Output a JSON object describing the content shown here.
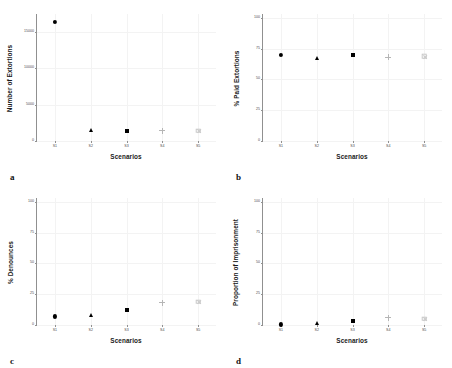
{
  "figure": {
    "panels": [
      {
        "letter": "a",
        "ylabel": "Number of Extortions",
        "xlabel": "Scenarios",
        "yticks": [
          "0",
          "5000",
          "10000",
          "15000"
        ],
        "ytick_values": [
          0,
          5000,
          10000,
          15000
        ],
        "ylim": [
          0,
          17500
        ],
        "xticks": [
          "S1",
          "S2",
          "S3",
          "S4",
          "S5"
        ],
        "values": [
          16400,
          1500,
          1380,
          1420,
          1400
        ],
        "markers": [
          "circle",
          "triangle",
          "square",
          "plus",
          "boxx"
        ]
      },
      {
        "letter": "b",
        "ylabel": "% Paid Extortions",
        "xlabel": "Scenarios",
        "yticks": [
          "0",
          "25",
          "50",
          "75",
          "100"
        ],
        "ytick_values": [
          0,
          25,
          50,
          75,
          100
        ],
        "ylim": [
          0,
          103
        ],
        "xticks": [
          "S1",
          "S2",
          "S3",
          "S4",
          "S5"
        ],
        "values": [
          70,
          67,
          70,
          68,
          69
        ],
        "markers": [
          "circle",
          "triangle",
          "square",
          "plus",
          "boxx"
        ]
      },
      {
        "letter": "c",
        "ylabel": "% Denounces",
        "xlabel": "Scenarios",
        "yticks": [
          "0",
          "25",
          "50",
          "75",
          "100"
        ],
        "ytick_values": [
          0,
          25,
          50,
          75,
          100
        ],
        "ylim": [
          0,
          103
        ],
        "xticks": [
          "S1",
          "S2",
          "S3",
          "S4",
          "S5"
        ],
        "values": [
          7,
          8,
          12,
          18,
          19
        ],
        "markers": [
          "circle",
          "triangle",
          "square",
          "plus",
          "boxx"
        ]
      },
      {
        "letter": "d",
        "ylabel": "Proportion of Imprisonment",
        "xlabel": "Scenarios",
        "yticks": [
          "0",
          "25",
          "50",
          "75",
          "100"
        ],
        "ytick_values": [
          0,
          25,
          50,
          75,
          100
        ],
        "ylim": [
          0,
          103
        ],
        "xticks": [
          "S1",
          "S2",
          "S3",
          "S4",
          "S5"
        ],
        "values": [
          0.5,
          2,
          3,
          6,
          5
        ],
        "markers": [
          "circle",
          "triangle",
          "square",
          "plus",
          "boxx"
        ]
      }
    ]
  },
  "chart_data": [
    {
      "type": "scatter",
      "title": "",
      "panel": "a",
      "xlabel": "Scenarios",
      "ylabel": "Number of Extortions",
      "categories": [
        "S1",
        "S2",
        "S3",
        "S4",
        "S5"
      ],
      "values": [
        16400,
        1500,
        1380,
        1420,
        1400
      ],
      "ylim": [
        0,
        17500
      ],
      "yticks": [
        0,
        5000,
        10000,
        15000
      ],
      "grid": true,
      "legend": "none",
      "markers": [
        "filled-circle",
        "filled-triangle",
        "filled-square",
        "gray-plus",
        "gray-boxed-x"
      ]
    },
    {
      "type": "scatter",
      "title": "",
      "panel": "b",
      "xlabel": "Scenarios",
      "ylabel": "% Paid Extortions",
      "categories": [
        "S1",
        "S2",
        "S3",
        "S4",
        "S5"
      ],
      "values": [
        70,
        67,
        70,
        68,
        69
      ],
      "ylim": [
        0,
        103
      ],
      "yticks": [
        0,
        25,
        50,
        75,
        100
      ],
      "grid": true,
      "legend": "none",
      "markers": [
        "filled-circle",
        "filled-triangle",
        "filled-square",
        "gray-plus",
        "gray-boxed-x"
      ]
    },
    {
      "type": "scatter",
      "title": "",
      "panel": "c",
      "xlabel": "Scenarios",
      "ylabel": "% Denounces",
      "categories": [
        "S1",
        "S2",
        "S3",
        "S4",
        "S5"
      ],
      "values": [
        7,
        8,
        12,
        18,
        19
      ],
      "ylim": [
        0,
        103
      ],
      "yticks": [
        0,
        25,
        50,
        75,
        100
      ],
      "grid": true,
      "legend": "none",
      "markers": [
        "filled-circle",
        "filled-triangle",
        "filled-square",
        "gray-plus",
        "gray-boxed-x"
      ]
    },
    {
      "type": "scatter",
      "title": "",
      "panel": "d",
      "xlabel": "Scenarios",
      "ylabel": "Proportion of Imprisonment",
      "categories": [
        "S1",
        "S2",
        "S3",
        "S4",
        "S5"
      ],
      "values": [
        0.5,
        2,
        3,
        6,
        5
      ],
      "ylim": [
        0,
        103
      ],
      "yticks": [
        0,
        25,
        50,
        75,
        100
      ],
      "grid": true,
      "legend": "none",
      "markers": [
        "filled-circle",
        "filled-triangle",
        "filled-square",
        "gray-plus",
        "gray-boxed-x"
      ]
    }
  ]
}
